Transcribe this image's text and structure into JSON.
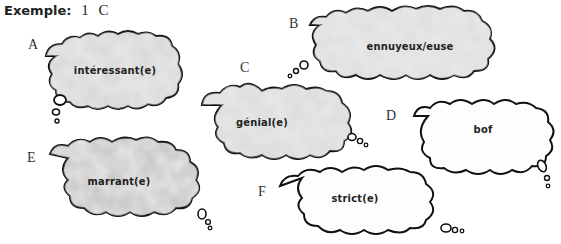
{
  "example": {
    "label": "Exemple:",
    "value": "1 C"
  },
  "clouds": [
    {
      "letter": "A",
      "word": "intéressant(e)",
      "shade": "grey"
    },
    {
      "letter": "B",
      "word": "ennuyeux/euse",
      "shade": "grey"
    },
    {
      "letter": "C",
      "word": "génial(e)",
      "shade": "grey"
    },
    {
      "letter": "D",
      "word": "bof",
      "shade": "white"
    },
    {
      "letter": "E",
      "word": "marrant(e)",
      "shade": "grey"
    },
    {
      "letter": "F",
      "word": "strict(e)",
      "shade": "white"
    }
  ]
}
